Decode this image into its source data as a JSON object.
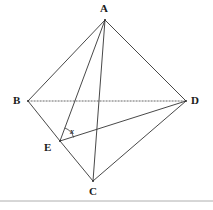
{
  "figure": {
    "type": "geometry-diagram",
    "canvas": {
      "width": 213,
      "height": 210
    },
    "background_color": "#ffffff",
    "stroke_color": "#333333",
    "label_color": "#1a1a1a",
    "points": [
      {
        "id": "A",
        "label": "A",
        "x": 105,
        "y": 20
      },
      {
        "id": "B",
        "label": "B",
        "x": 28,
        "y": 101
      },
      {
        "id": "C",
        "label": "C",
        "x": 93,
        "y": 181
      },
      {
        "id": "D",
        "label": "D",
        "x": 186,
        "y": 101
      },
      {
        "id": "E",
        "label": "E",
        "x": 60,
        "y": 141
      }
    ],
    "edges": [
      {
        "id": "AB",
        "from": "A",
        "to": "B",
        "style": "solid"
      },
      {
        "id": "AD",
        "from": "A",
        "to": "D",
        "style": "solid"
      },
      {
        "id": "AE",
        "from": "A",
        "to": "E",
        "style": "solid"
      },
      {
        "id": "AC",
        "from": "A",
        "to": "C",
        "style": "solid"
      },
      {
        "id": "BE",
        "from": "B",
        "to": "E",
        "style": "solid"
      },
      {
        "id": "EC",
        "from": "E",
        "to": "C",
        "style": "solid"
      },
      {
        "id": "ED",
        "from": "E",
        "to": "D",
        "style": "solid"
      },
      {
        "id": "CD",
        "from": "C",
        "to": "D",
        "style": "solid"
      },
      {
        "id": "BD",
        "from": "B",
        "to": "D",
        "style": "dotted"
      }
    ],
    "angles": [
      {
        "id": "x",
        "label": "x",
        "at": "E",
        "between": [
          "A",
          "D"
        ]
      }
    ],
    "baseline_rule": {
      "y": 201,
      "color": "#999999"
    }
  }
}
